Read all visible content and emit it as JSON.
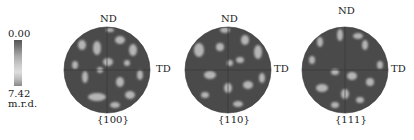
{
  "colorbar": {
    "min_label": "0.00",
    "max_label": "7.42",
    "unit": "m.r.d."
  },
  "pole_figures": [
    {
      "label": "{100}",
      "top_axis": "ND",
      "right_axis": "TD",
      "left_axis": "",
      "cx": 107
    },
    {
      "label": "{110}",
      "top_axis": "ND",
      "right_axis": "TD",
      "left_axis": "",
      "cx": 228
    },
    {
      "label": "{111}",
      "top_axis": "ND",
      "right_axis": "TD",
      "left_axis": "",
      "cx": 345
    }
  ],
  "colors": {
    "background": "#ffffff",
    "disk": "#4a4a4a",
    "spot": "#b8b8b8"
  }
}
